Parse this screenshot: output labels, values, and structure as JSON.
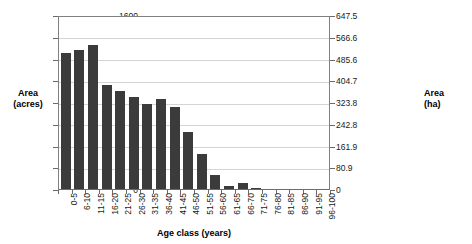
{
  "chart_data": {
    "type": "bar",
    "title": "",
    "xlabel": "Age class (years)",
    "ylabel": "Area\n(acres)",
    "ylabel_left_line1": "Area",
    "ylabel_left_line2": "(acres)",
    "ylabel_right_line1": "Area",
    "ylabel_right_line2": "(ha)",
    "categories": [
      "0-5",
      "6-10",
      "11-15",
      "16-20",
      "21-25",
      "26-30",
      "31-35",
      "36-40",
      "41-45",
      "46-50",
      "51-55",
      "56-60",
      "61-65",
      "66-70",
      "71-75",
      "76-80",
      "81-85",
      "86-90",
      "91-95",
      "96-100"
    ],
    "values": [
      1250,
      1280,
      1325,
      955,
      900,
      845,
      780,
      825,
      750,
      520,
      325,
      130,
      30,
      55,
      10,
      0,
      0,
      0,
      0,
      0
    ],
    "ylim": [
      0,
      1600
    ],
    "yticks_left": [
      0,
      200,
      400,
      600,
      800,
      1000,
      1200,
      1400,
      1600
    ],
    "ylim_right": [
      0,
      647.5
    ],
    "yticks_right": [
      "0",
      "80.9",
      "161.9",
      "242.8",
      "323.8",
      "404.7",
      "485.6",
      "566.6",
      "647.5"
    ],
    "grid": true,
    "legend": false,
    "bar_color": "#3b3b3b",
    "grid_color": "#d4d4d4",
    "axis_color": "#808080",
    "background": "#ffffff"
  }
}
